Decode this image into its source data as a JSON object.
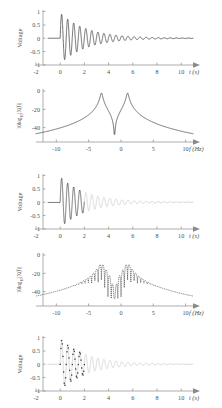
{
  "figure": {
    "title": "",
    "panel_count": 5
  },
  "chart_data": [
    {
      "id": "panel1",
      "type": "line",
      "title": "",
      "xlabel": "t (s)",
      "ylabel": "Voltage",
      "xlim": [
        -2,
        11
      ],
      "ylim": [
        -1,
        1
      ],
      "xticks": [
        -2,
        0,
        2,
        4,
        6,
        8,
        10
      ],
      "xticklabels": [
        "-2",
        "0",
        "2",
        "4",
        "6",
        "8",
        "10"
      ],
      "yticks": [
        -1,
        -0.5,
        0,
        0.5,
        1
      ],
      "yticklabels": [
        "-1",
        "-0.5",
        "0",
        "0.5",
        "1"
      ],
      "grid": false,
      "legend": null,
      "description": "Damped sinusoid starting at t=0, frequency 2 Hz, slow exponential decay persisting to t=10",
      "signal": {
        "kind": "damped_sine",
        "start_time": 0.0,
        "frequency_hz": 2.0,
        "decay_tau_s": 2.2,
        "amplitude": 0.95,
        "truncate_time": null
      }
    },
    {
      "id": "panel2",
      "type": "line",
      "title": "",
      "xlabel": "f (Hz)",
      "ylabel_parts": {
        "pre": "10log",
        "sub": "10",
        "post": "|X(f)|"
      },
      "ylabel": "10log10|X(f)|",
      "xlim": [
        -12,
        12
      ],
      "ylim": [
        -48,
        2
      ],
      "xticks": [
        -10,
        -5,
        0,
        5,
        10
      ],
      "xticklabels": [
        "-10",
        "-5",
        "0",
        "5",
        "10"
      ],
      "yticks": [
        -40,
        -20,
        0
      ],
      "yticklabels": [
        "-40",
        "-20",
        "0"
      ],
      "grid": false,
      "legend": null,
      "description": "Lorentzian spectrum with two sharp resonance peaks at -2 Hz and +2 Hz reaching 0 dB, deep notch at f=0",
      "spectrum": {
        "kind": "lorentzian_pair",
        "peak_freqs": [
          -2,
          2
        ],
        "peak_level_db": 0,
        "notch_level_db": -46,
        "edge_level_db": -38,
        "half_width_hz": 0.16,
        "ripple": false
      }
    },
    {
      "id": "panel3",
      "type": "line",
      "title": "",
      "xlabel": "t (s)",
      "ylabel": "Voltage",
      "xlim": [
        -2,
        11
      ],
      "ylim": [
        -1,
        1
      ],
      "xticks": [
        -2,
        0,
        2,
        4,
        6,
        8,
        10
      ],
      "xticklabels": [
        "-2",
        "0",
        "2",
        "4",
        "6",
        "8",
        "10"
      ],
      "yticks": [
        -1,
        -0.5,
        0,
        0.5,
        1
      ],
      "yticklabels": [
        "-1",
        "-0.5",
        "0",
        "0.5",
        "1"
      ],
      "grid": false,
      "legend": null,
      "description": "Same damped sinusoid but truncated (windowed) at t=2 s; the remaining tail is drawn faint grey",
      "signal": {
        "kind": "damped_sine_truncated",
        "start_time": 0.0,
        "frequency_hz": 2.0,
        "decay_tau_s": 2.2,
        "amplitude": 0.95,
        "truncate_time": 2.0
      }
    },
    {
      "id": "panel4",
      "type": "line",
      "title": "",
      "xlabel": "f (Hz)",
      "ylabel_parts": {
        "pre": "10log",
        "sub": "10",
        "post": "|X(f)|"
      },
      "ylabel": "10log10|X(f)|",
      "xlim": [
        -12,
        12
      ],
      "ylim": [
        -48,
        2
      ],
      "xticks": [
        -10,
        -5,
        0,
        5,
        10
      ],
      "xticklabels": [
        "-10",
        "-5",
        "0",
        "5",
        "10"
      ],
      "yticks": [
        -40,
        -20,
        0
      ],
      "yticklabels": [
        "-40",
        "-20",
        "0"
      ],
      "grid": false,
      "legend": null,
      "description": "Spectrum of the truncated signal: broadened peaks at -2 and +2 Hz near -7 dB with sidelobe ripples between them",
      "spectrum": {
        "kind": "lorentzian_pair_windowed",
        "peak_freqs": [
          -2,
          2
        ],
        "peak_level_db": -7,
        "notch_level_db": -40,
        "edge_level_db": -38,
        "half_width_hz": 0.45,
        "ripple": true
      }
    },
    {
      "id": "panel5",
      "type": "scatter",
      "title": "",
      "xlabel": "t (s)",
      "ylabel": "Voltage",
      "xlim": [
        -2,
        11
      ],
      "ylim": [
        -1,
        1
      ],
      "xticks": [
        -2,
        0,
        2,
        4,
        6,
        8,
        10
      ],
      "xticklabels": [
        "-2",
        "0",
        "2",
        "4",
        "6",
        "8",
        "10"
      ],
      "yticks": [
        -1,
        -0.5,
        0,
        0.5,
        1
      ],
      "yticklabels": [
        "-1",
        "-0.5",
        "0",
        "0.5",
        "1"
      ],
      "grid": false,
      "legend": null,
      "description": "Discrete sampled points of the damped sinusoid between t=0 and t=2 over a faint grey continuous waveform",
      "signal": {
        "kind": "sampled_damped_sine",
        "start_time": 0.0,
        "frequency_hz": 2.0,
        "decay_tau_s": 2.2,
        "amplitude": 0.95,
        "sample_interval_s": 0.0555,
        "sample_range": [
          0.0,
          2.0
        ]
      }
    }
  ]
}
